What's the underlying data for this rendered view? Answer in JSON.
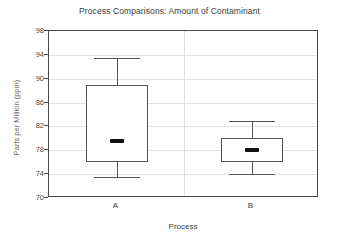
{
  "chart_data": {
    "type": "box",
    "title": "Process Comparisons: Amount of Contaminant",
    "xlabel": "Process",
    "ylabel": "Parts per Million (ppm)",
    "categories": [
      "A",
      "B"
    ],
    "ylim": [
      70,
      98
    ],
    "yticks": [
      70,
      74,
      78,
      82,
      86,
      90,
      94,
      98
    ],
    "grid": true,
    "legend": "none",
    "boxes": [
      {
        "name": "A",
        "whisker_low": 73.5,
        "q1": 76.0,
        "median": 79.5,
        "q3": 89.0,
        "whisker_high": 93.5
      },
      {
        "name": "B",
        "whisker_low": 74.0,
        "q1": 76.0,
        "median": 78.0,
        "q3": 80.0,
        "whisker_high": 83.0
      }
    ],
    "colors": {
      "box_edge": "#555555",
      "box_fill": "#ffffff",
      "median": "#111111",
      "grid": "#e2e2e2",
      "frame": "#4a4a4a",
      "text": "#3a3a3a",
      "axis_title": "#6a6a6a"
    }
  },
  "axis": {
    "ytick_labels": [
      "98",
      "94",
      "90",
      "86",
      "82",
      "78",
      "74",
      "70"
    ],
    "xtick_labels": [
      "A",
      "B"
    ]
  }
}
